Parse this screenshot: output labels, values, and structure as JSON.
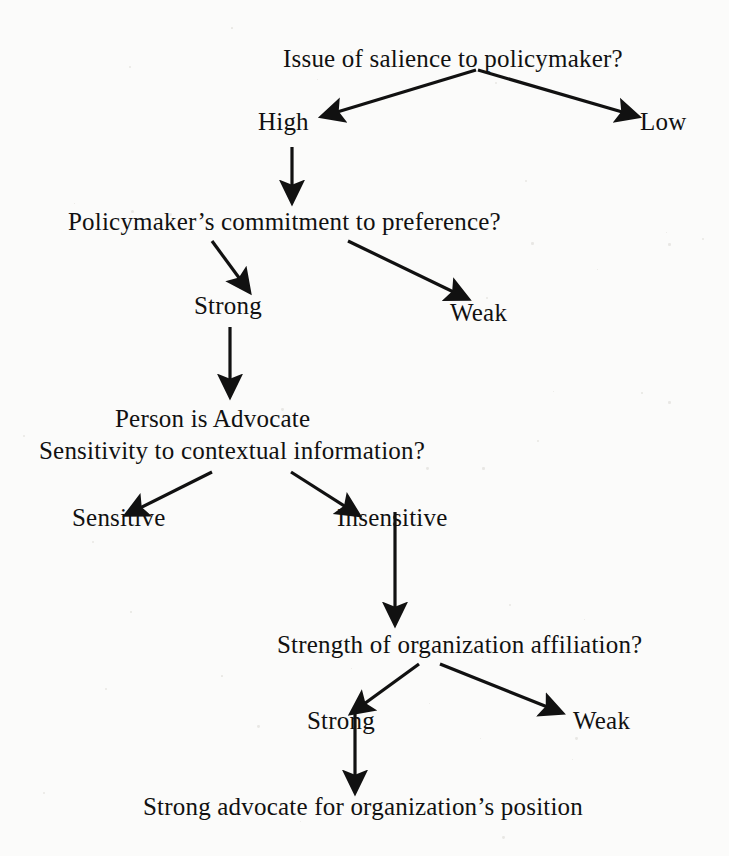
{
  "diagram": {
    "title": "Issue of salience to policymaker?",
    "type": "decision-tree",
    "ink_color": "#111111",
    "background_color": "#fbfbfa",
    "nodes": [
      {
        "id": "q1",
        "kind": "question",
        "text": "Issue of salience to policymaker?",
        "x": 283,
        "y": 46
      },
      {
        "id": "o1a",
        "kind": "option",
        "text": "High",
        "x": 258,
        "y": 109
      },
      {
        "id": "o1b",
        "kind": "option",
        "text": "Low",
        "x": 640,
        "y": 109
      },
      {
        "id": "q2",
        "kind": "question",
        "text": "Policymaker’s commitment to preference?",
        "x": 68,
        "y": 209
      },
      {
        "id": "o2a",
        "kind": "option",
        "text": "Strong",
        "x": 194,
        "y": 293
      },
      {
        "id": "o2b",
        "kind": "option",
        "text": "Weak",
        "x": 450,
        "y": 300
      },
      {
        "id": "q3a",
        "kind": "question",
        "text": "Person is Advocate",
        "x": 115,
        "y": 406
      },
      {
        "id": "q3b",
        "kind": "question",
        "text": "Sensitivity to contextual information?",
        "x": 39,
        "y": 438
      },
      {
        "id": "o3a",
        "kind": "option",
        "text": "Sensitive",
        "x": 72,
        "y": 505
      },
      {
        "id": "o3b",
        "kind": "option",
        "text": "Insensitive",
        "x": 337,
        "y": 505
      },
      {
        "id": "q4",
        "kind": "question",
        "text": "Strength of organization affiliation?",
        "x": 277,
        "y": 632
      },
      {
        "id": "o4a",
        "kind": "option",
        "text": "Strong",
        "x": 307,
        "y": 708
      },
      {
        "id": "o4b",
        "kind": "option",
        "text": "Weak",
        "x": 573,
        "y": 708
      },
      {
        "id": "out1",
        "kind": "outcome",
        "text": "Strong advocate for organization’s position",
        "x": 143,
        "y": 794
      }
    ],
    "edges": [
      {
        "id": "e1",
        "from": "q1",
        "to": "o1a",
        "label": "",
        "x1": 476,
        "y1": 70,
        "x2": 324,
        "y2": 116
      },
      {
        "id": "e2",
        "from": "q1",
        "to": "o1b",
        "label": "",
        "x1": 478,
        "y1": 70,
        "x2": 636,
        "y2": 116
      },
      {
        "id": "e3",
        "from": "o1a",
        "to": "q2",
        "label": "",
        "x1": 292,
        "y1": 147,
        "x2": 292,
        "y2": 200
      },
      {
        "id": "e4",
        "from": "q2",
        "to": "o2a",
        "label": "",
        "x1": 212,
        "y1": 241,
        "x2": 248,
        "y2": 290
      },
      {
        "id": "e5",
        "from": "q2",
        "to": "o2b",
        "label": "",
        "x1": 348,
        "y1": 241,
        "x2": 466,
        "y2": 298
      },
      {
        "id": "e6",
        "from": "o2a",
        "to": "q3a",
        "label": "",
        "x1": 230,
        "y1": 327,
        "x2": 230,
        "y2": 394
      },
      {
        "id": "e7",
        "from": "q3b",
        "to": "o3a",
        "label": "",
        "x1": 212,
        "y1": 472,
        "x2": 128,
        "y2": 514
      },
      {
        "id": "e8",
        "from": "q3b",
        "to": "o3b",
        "label": "",
        "x1": 291,
        "y1": 472,
        "x2": 357,
        "y2": 514
      },
      {
        "id": "e9",
        "from": "o3b",
        "to": "q4",
        "label": "",
        "x1": 395,
        "y1": 512,
        "x2": 395,
        "y2": 622
      },
      {
        "id": "e10",
        "from": "q4",
        "to": "o4a",
        "label": "",
        "x1": 419,
        "y1": 664,
        "x2": 353,
        "y2": 712
      },
      {
        "id": "e11",
        "from": "q4",
        "to": "o4b",
        "label": "",
        "x1": 440,
        "y1": 664,
        "x2": 560,
        "y2": 712
      },
      {
        "id": "e12",
        "from": "o4a",
        "to": "out1",
        "label": "",
        "x1": 355,
        "y1": 708,
        "x2": 355,
        "y2": 790
      }
    ]
  }
}
